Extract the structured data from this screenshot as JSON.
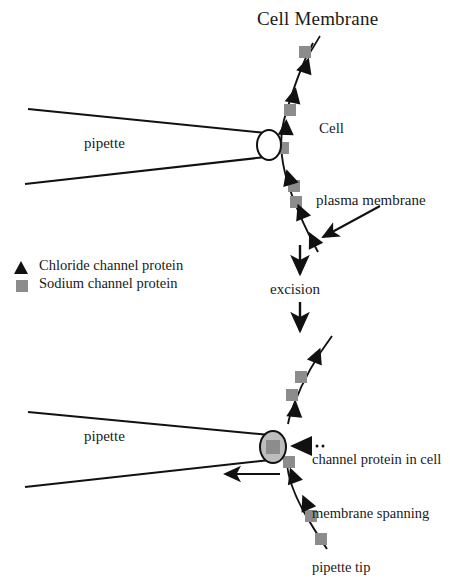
{
  "figure": {
    "title": "Cell Membrane",
    "width": 450,
    "height": 556,
    "background_color": "#ffffff"
  },
  "colors": {
    "stroke": "#111111",
    "chloride_marker": "#111111",
    "sodium_marker": "#8c8c8c",
    "pipette_tip_fill": "#bdbdbd",
    "patch_square_fill": "#8c8c8c",
    "text": "#1a1a1a"
  },
  "labels": {
    "title": "Cell Membrane",
    "cell": "Cell",
    "plasma_membrane": "plasma membrane",
    "excision": "excision",
    "pipette_top": "pipette",
    "pipette_bottom": "pipette"
  },
  "legend": {
    "items": [
      {
        "marker": "triangle-marker",
        "shape": "triangle",
        "color": "#111111",
        "label": "Chloride channel protein"
      },
      {
        "marker": "square-marker",
        "shape": "square",
        "color": "#8c8c8c",
        "label": "Sodium channel protein"
      }
    ]
  },
  "annotation": {
    "lines": [
      "channel protein in cell",
      "membrane spanning",
      "pipette tip"
    ]
  },
  "top_panel": {
    "name": "cell-attached-panel",
    "membrane_path": "M 312 44 L 297 86 L 287 118 L 281 142 L 285 168 L 292 196 L 303 224 L 318 252",
    "pipette": {
      "upper_edge": "M 28 109 L 265 134",
      "lower_edge": "M 25 184 L 265 157",
      "tip_ellipse": {
        "cx": 269,
        "cy": 144,
        "rx": 12,
        "ry": 15
      }
    },
    "chloride_positions": [
      {
        "x": 306,
        "y": 66,
        "rot": 18
      },
      {
        "x": 294,
        "y": 96,
        "rot": 12
      },
      {
        "x": 286,
        "y": 128,
        "rot": 4
      },
      {
        "x": 288,
        "y": 180,
        "rot": -16
      },
      {
        "x": 300,
        "y": 212,
        "rot": -22
      },
      {
        "x": 312,
        "y": 240,
        "rot": -26
      }
    ],
    "sodium_positions": [
      {
        "x": 306,
        "y": 52
      },
      {
        "x": 290,
        "y": 110
      },
      {
        "x": 283,
        "y": 148
      },
      {
        "x": 294,
        "y": 186
      },
      {
        "x": 296,
        "y": 202
      }
    ],
    "plasma_membrane_arrow": "M 378 208 L 322 238"
  },
  "transition": {
    "arrow_above": "M 300 246 L 300 276",
    "arrow_below": "M 300 300 L 300 330"
  },
  "bottom_panel": {
    "name": "excised-patch-panel",
    "membrane_upper": "M 330 338 L 310 372 L 296 400 L 290 420",
    "membrane_lower": "M 288 462 L 296 492 L 310 520 L 326 548",
    "pipette": {
      "upper_edge": "M 28 413 L 268 438",
      "lower_edge": "M 25 487 L 268 460",
      "tip_ellipse": {
        "cx": 272,
        "cy": 447,
        "rx": 13,
        "ry": 16
      },
      "patch_square": {
        "x": 266,
        "y": 441,
        "size": 13
      }
    },
    "chloride_positions": [
      {
        "x": 316,
        "y": 357,
        "rot": 22
      },
      {
        "x": 294,
        "y": 410,
        "rot": 6
      },
      {
        "x": 292,
        "y": 473,
        "rot": -20
      },
      {
        "x": 305,
        "y": 502,
        "rot": -24
      }
    ],
    "sodium_positions": [
      {
        "x": 301,
        "y": 377
      },
      {
        "x": 292,
        "y": 393
      },
      {
        "x": 289,
        "y": 460
      },
      {
        "x": 311,
        "y": 516
      },
      {
        "x": 321,
        "y": 538
      }
    ],
    "annotation_arrow": "M 310 445 L 290 445",
    "suction_arrow": "M 278 474 L 224 474"
  }
}
